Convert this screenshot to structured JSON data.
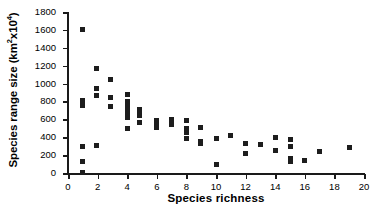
{
  "chart_data": {
    "type": "scatter",
    "title": "",
    "xlabel": "Species richness",
    "ylabel_parts": {
      "pre": "Species range size (km",
      "sup1": "2",
      "mid": "x10",
      "sup2": "4",
      "post": ")"
    },
    "ylabel_plain": "Species range size (km2x104)",
    "xlim": [
      0,
      20
    ],
    "ylim": [
      0,
      1800
    ],
    "xticks": [
      0,
      2,
      4,
      6,
      8,
      10,
      12,
      14,
      16,
      18,
      20
    ],
    "yticks": [
      0,
      200,
      400,
      600,
      800,
      1000,
      1200,
      1400,
      1600,
      1800
    ],
    "grid": false,
    "legend": null,
    "marker": "square",
    "marker_color": "#1d1d1d",
    "points": [
      [
        1,
        1600
      ],
      [
        1,
        810
      ],
      [
        1,
        750
      ],
      [
        1,
        295
      ],
      [
        1,
        125
      ],
      [
        1,
        5
      ],
      [
        1.9,
        1170
      ],
      [
        1.9,
        950
      ],
      [
        1.9,
        865
      ],
      [
        1.95,
        310
      ],
      [
        2.85,
        1050
      ],
      [
        2.85,
        845
      ],
      [
        2.85,
        745
      ],
      [
        4,
        875
      ],
      [
        4,
        800
      ],
      [
        4,
        760
      ],
      [
        4,
        710
      ],
      [
        4,
        680
      ],
      [
        4,
        650
      ],
      [
        4,
        620
      ],
      [
        4,
        500
      ],
      [
        4.85,
        710
      ],
      [
        4.85,
        690
      ],
      [
        4.85,
        665
      ],
      [
        4.85,
        645
      ],
      [
        4.85,
        565
      ],
      [
        6,
        590
      ],
      [
        6,
        545
      ],
      [
        6,
        510
      ],
      [
        7,
        595
      ],
      [
        7,
        565
      ],
      [
        7,
        545
      ],
      [
        8,
        590
      ],
      [
        8,
        495
      ],
      [
        8,
        470
      ],
      [
        8,
        450
      ],
      [
        8,
        390
      ],
      [
        8.95,
        505
      ],
      [
        8.95,
        355
      ],
      [
        8.95,
        330
      ],
      [
        10,
        390
      ],
      [
        10,
        100
      ],
      [
        11,
        415
      ],
      [
        12,
        330
      ],
      [
        12,
        215
      ],
      [
        13,
        315
      ],
      [
        14,
        395
      ],
      [
        14,
        255
      ],
      [
        15,
        370
      ],
      [
        15,
        300
      ],
      [
        15,
        165
      ],
      [
        15,
        130
      ],
      [
        16,
        145
      ],
      [
        17,
        235
      ],
      [
        19,
        280
      ]
    ]
  }
}
